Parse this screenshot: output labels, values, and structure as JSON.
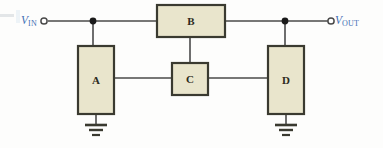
{
  "figure": {
    "type": "block-diagram",
    "title": "",
    "background_color": "#fdfdfc"
  },
  "style": {
    "wire_color": "#4a4a4a",
    "block_fill": "#e9e5cc",
    "block_border": "#3a3a30",
    "label_color": "#3f6fb5",
    "letter_color": "#2c2a20",
    "node_color": "#1a1a1a"
  },
  "terminals": [
    {
      "id": "vin",
      "label_v": "V",
      "label_sub": "IN",
      "marker": "open-circle-terminal",
      "x": 44,
      "y": 21,
      "side": "left"
    },
    {
      "id": "vout",
      "label_v": "V",
      "label_sub": "OUT",
      "marker": "open-circle-terminal",
      "x": 331,
      "y": 21,
      "side": "right"
    }
  ],
  "blocks": [
    {
      "id": "A",
      "letter": "A",
      "x": 78,
      "y": 46,
      "w": 36,
      "h": 68,
      "shape": "tall-rect"
    },
    {
      "id": "B",
      "letter": "B",
      "x": 157,
      "y": 5,
      "w": 68,
      "h": 32,
      "shape": "wide-rect"
    },
    {
      "id": "C",
      "letter": "C",
      "x": 172,
      "y": 63,
      "w": 36,
      "h": 32,
      "shape": "square"
    },
    {
      "id": "D",
      "letter": "D",
      "x": 268,
      "y": 46,
      "w": 36,
      "h": 68,
      "shape": "tall-rect"
    }
  ],
  "nodes": [
    {
      "id": "node-in",
      "x": 93,
      "y": 21
    },
    {
      "id": "node-out",
      "x": 285,
      "y": 21
    }
  ],
  "grounds": [
    {
      "id": "ground-a",
      "x": 96,
      "y": 122
    },
    {
      "id": "ground-d",
      "x": 286,
      "y": 122
    }
  ],
  "wires": [
    {
      "id": "wire-vin-to-node",
      "from": "vin",
      "to": "node-in",
      "path": "48,21 93,21"
    },
    {
      "id": "wire-node-to-b",
      "from": "node-in",
      "to": "B",
      "path": "93,21 157,21"
    },
    {
      "id": "wire-b-to-node-out",
      "from": "B",
      "to": "node-out",
      "path": "225,21 285,21"
    },
    {
      "id": "wire-node-to-vout",
      "from": "node-out",
      "to": "vout",
      "path": "285,21 327,21"
    },
    {
      "id": "wire-node-in-to-a",
      "from": "node-in",
      "to": "A",
      "path": "93,21 93,46"
    },
    {
      "id": "wire-node-out-to-d",
      "from": "node-out",
      "to": "D",
      "path": "285,21 285,46"
    },
    {
      "id": "wire-b-to-c",
      "from": "B",
      "to": "C",
      "path": "190,37 190,63"
    },
    {
      "id": "wire-a-to-c",
      "from": "A",
      "to": "C",
      "path": "114,78 172,78"
    },
    {
      "id": "wire-c-to-d",
      "from": "C",
      "to": "D",
      "path": "208,78 268,78"
    },
    {
      "id": "wire-a-to-ground",
      "from": "A",
      "to": "ground-a",
      "path": "96,114 96,124"
    },
    {
      "id": "wire-d-to-ground",
      "from": "D",
      "to": "ground-d",
      "path": "286,114 286,124"
    }
  ]
}
